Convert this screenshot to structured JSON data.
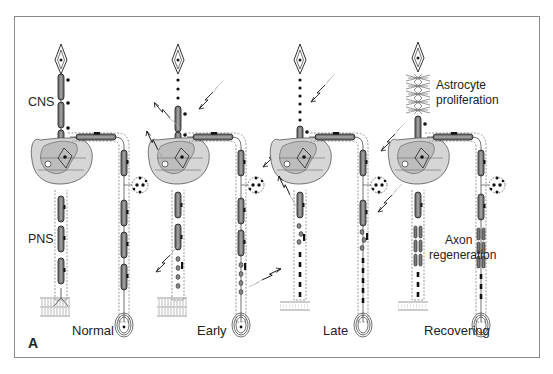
{
  "figure": {
    "panel_letter": "A",
    "region_labels": {
      "cns": "CNS",
      "pns": "PNS"
    },
    "stages": [
      {
        "id": "normal",
        "label": "Normal"
      },
      {
        "id": "early",
        "label": "Early"
      },
      {
        "id": "late",
        "label": "Late"
      },
      {
        "id": "recovering",
        "label": "Recovering"
      }
    ],
    "annotations": {
      "astrocyte": "Astrocyte\nproliferation",
      "astrocyte_line1": "Astrocyte",
      "astrocyte_line2": "proliferation",
      "axon_line1": "Axon",
      "axon_line2": "regeneration"
    },
    "colors": {
      "frame": "#8a8a8a",
      "ink": "#1a1a1a",
      "myelin_fill": "#7a7a7a",
      "cord_fill": "#d6d6d6",
      "grey_matter": "#bdbdbd"
    }
  }
}
